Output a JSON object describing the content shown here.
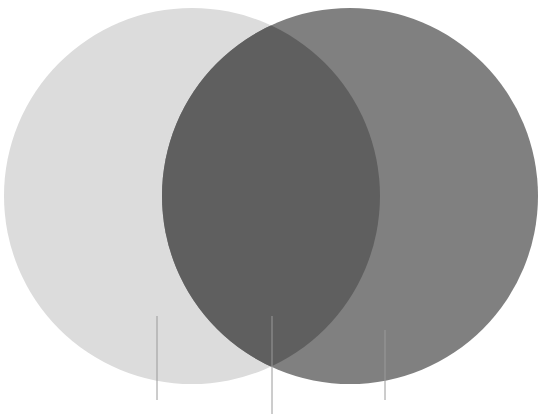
{
  "diagram": {
    "type": "venn",
    "background": "#ffffff",
    "sets": [
      {
        "name": "left-set",
        "cx": 192,
        "cy": 196,
        "r": 188,
        "color": "#dcdcdc"
      },
      {
        "name": "right-set",
        "cx": 350,
        "cy": 196,
        "r": 188,
        "color": "#808080"
      }
    ],
    "intersection_color": "#5f5f5f",
    "leader_lines": [
      {
        "name": "left-leader",
        "x": 157,
        "y1": 316,
        "y2": 400
      },
      {
        "name": "intersection-leader",
        "x": 272,
        "y1": 316,
        "y2": 414
      },
      {
        "name": "right-leader",
        "x": 385,
        "y1": 330,
        "y2": 400
      }
    ],
    "line_color": "#9a9a9a"
  }
}
